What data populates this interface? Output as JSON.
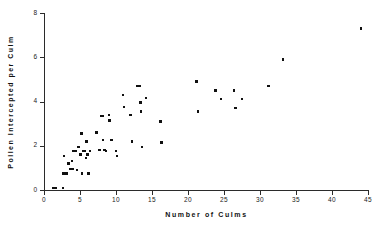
{
  "chart_data": {
    "type": "scatter",
    "title": "",
    "xlabel": "Number of Culms",
    "ylabel": "Pollen Intercepted per Culm",
    "xlim": [
      0,
      45
    ],
    "ylim": [
      0,
      8
    ],
    "xticks": [
      0,
      5,
      10,
      15,
      20,
      25,
      30,
      35,
      40,
      45
    ],
    "yticks": [
      0,
      2,
      4,
      6,
      8
    ],
    "grid": false,
    "legend": null,
    "marker": "filled-square",
    "marker_color": "#101010",
    "points": [
      [
        1.3,
        0.1
      ],
      [
        1.7,
        0.1
      ],
      [
        2.6,
        0.1
      ],
      [
        2.7,
        0.75
      ],
      [
        2.8,
        1.55
      ],
      [
        3.1,
        0.75
      ],
      [
        3.4,
        1.2
      ],
      [
        3.6,
        0.95
      ],
      [
        3.7,
        0.95
      ],
      [
        3.9,
        1.3
      ],
      [
        4.0,
        0.95
      ],
      [
        4.1,
        1.75
      ],
      [
        4.4,
        1.75
      ],
      [
        4.6,
        0.9
      ],
      [
        4.8,
        1.95
      ],
      [
        5.0,
        1.6
      ],
      [
        5.1,
        1.6
      ],
      [
        5.2,
        2.55
      ],
      [
        5.3,
        0.75
      ],
      [
        5.5,
        1.75
      ],
      [
        5.6,
        1.75
      ],
      [
        5.8,
        1.45
      ],
      [
        5.9,
        2.2
      ],
      [
        6.0,
        1.6
      ],
      [
        6.1,
        1.6
      ],
      [
        6.2,
        0.75
      ],
      [
        6.4,
        1.75
      ],
      [
        7.3,
        2.6
      ],
      [
        7.7,
        1.8
      ],
      [
        8.0,
        3.35
      ],
      [
        8.1,
        3.35
      ],
      [
        8.2,
        2.25
      ],
      [
        8.4,
        1.8
      ],
      [
        8.6,
        1.75
      ],
      [
        9.0,
        3.4
      ],
      [
        9.1,
        3.15
      ],
      [
        9.4,
        2.25
      ],
      [
        10.0,
        1.75
      ],
      [
        10.1,
        1.55
      ],
      [
        11.0,
        4.3
      ],
      [
        11.1,
        3.75
      ],
      [
        12.0,
        3.4
      ],
      [
        12.2,
        2.2
      ],
      [
        13.0,
        4.7
      ],
      [
        13.3,
        4.7
      ],
      [
        13.4,
        3.95
      ],
      [
        13.5,
        3.55
      ],
      [
        13.6,
        1.95
      ],
      [
        14.2,
        4.15
      ],
      [
        16.2,
        3.1
      ],
      [
        16.3,
        2.15
      ],
      [
        21.2,
        4.9
      ],
      [
        21.4,
        3.55
      ],
      [
        23.8,
        4.5
      ],
      [
        24.6,
        4.1
      ],
      [
        26.4,
        4.5
      ],
      [
        26.6,
        3.7
      ],
      [
        27.5,
        4.1
      ],
      [
        31.2,
        4.7
      ],
      [
        33.2,
        5.9
      ],
      [
        44.0,
        7.3
      ]
    ]
  },
  "axes": {
    "x_tick_labels": [
      "0",
      "5",
      "10",
      "15",
      "20",
      "25",
      "30",
      "35",
      "40",
      "45"
    ],
    "y_tick_labels": [
      "0",
      "2",
      "4",
      "6",
      "8"
    ],
    "x_title": "Number  of  Culms",
    "y_title": "Pollen  Intercepted  per  Culm"
  }
}
